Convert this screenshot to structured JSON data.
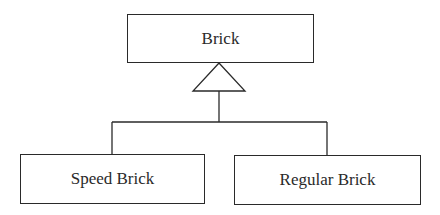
{
  "diagram": {
    "type": "uml-class-inheritance",
    "parent": {
      "label": "Brick"
    },
    "children": [
      {
        "label": "Speed Brick"
      },
      {
        "label": "Regular Brick"
      }
    ],
    "relationship": "generalization",
    "colors": {
      "line": "#2a2a2a",
      "background": "#ffffff",
      "text": "#2a2a2a"
    }
  }
}
